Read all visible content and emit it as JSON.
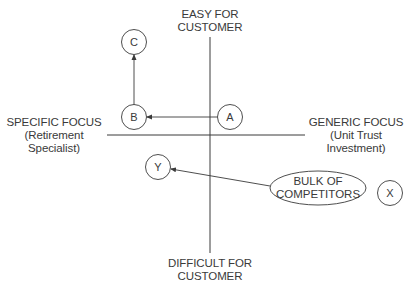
{
  "axes": {
    "top": {
      "line1": "EASY FOR",
      "line2": "CUSTOMER"
    },
    "bottom": {
      "line1": "DIFFICULT FOR",
      "line2": "CUSTOMER"
    },
    "left": {
      "line1": "SPECIFIC FOCUS",
      "line2": "(Retirement",
      "line3": "Specialist)"
    },
    "right": {
      "line1": "GENERIC FOCUS",
      "line2": "(Unit Trust",
      "line3": "Investment)"
    }
  },
  "nodes": {
    "a": "A",
    "b": "B",
    "c": "C",
    "x": "X",
    "y": "Y"
  },
  "competitors": {
    "line1": "BULK OF",
    "line2": "COMPETITORS"
  },
  "arrows": [
    {
      "from": "A",
      "to": "B"
    },
    {
      "from": "B",
      "to": "C"
    },
    {
      "from": "BULK OF COMPETITORS",
      "to": "Y"
    }
  ],
  "colors": {
    "stroke": "#3a3a3a",
    "background": "#ffffff"
  }
}
